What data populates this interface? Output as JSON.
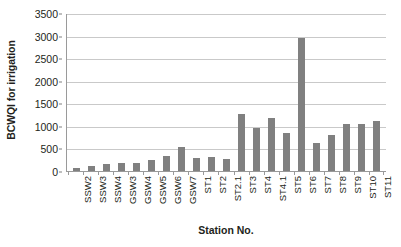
{
  "chart_data": {
    "type": "bar",
    "title": "",
    "xlabel": "Station No.",
    "ylabel": "BCWQI for irrigation",
    "categories": [
      "SSW2",
      "SSW3",
      "SSW4",
      "GSW3",
      "GSW4",
      "GSW5",
      "GSW6",
      "GSW7",
      "ST1",
      "ST2",
      "ST2.1",
      "ST3",
      "ST4",
      "ST4.1",
      "ST5",
      "ST6",
      "ST7",
      "ST8",
      "ST9",
      "ST10",
      "ST11"
    ],
    "values": [
      60,
      110,
      155,
      175,
      180,
      250,
      340,
      540,
      290,
      300,
      270,
      1270,
      950,
      1180,
      850,
      2940,
      630,
      790,
      1040,
      1050,
      1100
    ],
    "ylim": [
      0,
      3500
    ],
    "ytick_step": 500,
    "yticks": [
      "3500",
      "3000",
      "2500",
      "2000",
      "1500",
      "1000",
      "500",
      "0"
    ],
    "grid": true,
    "legend": false,
    "bar_color": "#808080",
    "gridline_color": "#c9c9c9",
    "axis_color": "#9a9a9a",
    "text_color": "#231f20"
  }
}
